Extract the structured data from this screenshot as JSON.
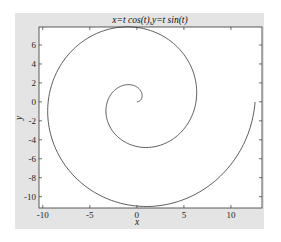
{
  "chart_data": {
    "type": "line",
    "title": "x=t cos(t),y=t sin(t)",
    "xlabel": "x",
    "ylabel": "y",
    "xlim": [
      -10.4,
      13.3
    ],
    "ylim": [
      -11.2,
      7.9
    ],
    "xticks": [
      -10,
      -5,
      0,
      5,
      10
    ],
    "xtick_labels": [
      "-10",
      "-5",
      "0",
      "5",
      "10"
    ],
    "yticks": [
      6,
      4,
      2,
      0,
      -2,
      -4,
      -6,
      -8,
      -10
    ],
    "ytick_labels": [
      "6",
      "4",
      "2",
      "0",
      "-2",
      "-4",
      "-6",
      "-8",
      "-10"
    ],
    "grid": false,
    "legend": null,
    "series": [
      {
        "name": "spiral",
        "parametric": "x=t*cos(t), y=t*sin(t)",
        "t_range": [
          0,
          12.566
        ],
        "color": "#333333",
        "sample_points": [
          {
            "t": 0,
            "x": 0,
            "y": 0
          },
          {
            "t": 1.571,
            "x": 0,
            "y": 1.57
          },
          {
            "t": 3.142,
            "x": -3.14,
            "y": 0
          },
          {
            "t": 4.712,
            "x": 0,
            "y": -4.71
          },
          {
            "t": 6.283,
            "x": 6.28,
            "y": 0
          },
          {
            "t": 7.854,
            "x": 0,
            "y": 7.85
          },
          {
            "t": 9.425,
            "x": -9.42,
            "y": 0
          },
          {
            "t": 10.996,
            "x": 0,
            "y": -11.0
          },
          {
            "t": 12.566,
            "x": 12.57,
            "y": 0
          }
        ]
      }
    ]
  },
  "colors": {
    "figure_bg": "#e4e4e4",
    "axes_bg": "#ffffff",
    "line": "#333333"
  }
}
